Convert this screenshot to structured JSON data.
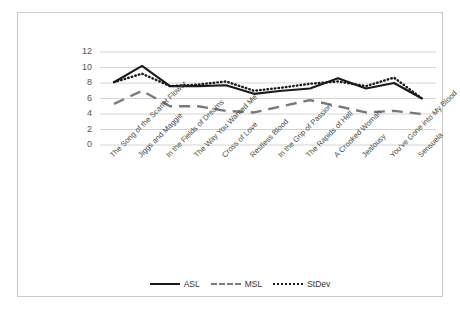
{
  "chart_data": {
    "type": "line",
    "title": "",
    "xlabel": "",
    "ylabel": "",
    "ylim": [
      0,
      12
    ],
    "ytick_step": 2,
    "yticks": [
      12,
      10,
      8,
      6,
      4,
      2,
      0
    ],
    "grid": "horizontal",
    "legend_position": "bottom",
    "categories": [
      "The Song of the Scarlet Flower",
      "Jiggs and Maggie",
      "In the Fields of Dreams",
      "The Way You Wanted Me",
      "Cross of Love",
      "Restless Blood",
      "In the Grip of Passion",
      "The Rapids of Hell",
      "A Crooked Woman",
      "Jealousy",
      "You've Gone into My Blood",
      "Sensuela"
    ],
    "series": [
      {
        "name": "ASL",
        "style": "solid",
        "color": "#1a1a1a",
        "values": [
          8.1,
          10.2,
          7.6,
          7.6,
          7.7,
          6.6,
          7.0,
          7.3,
          8.6,
          7.3,
          8.0,
          6.0
        ]
      },
      {
        "name": "MSL",
        "style": "dashed",
        "color": "#7a7a7a",
        "values": [
          5.3,
          7.0,
          5.0,
          5.0,
          4.4,
          4.2,
          5.0,
          5.8,
          5.0,
          4.2,
          4.4,
          4.0
        ]
      },
      {
        "name": "StDev",
        "style": "dotted",
        "color": "#1a1a1a",
        "values": [
          8.1,
          9.2,
          7.6,
          7.8,
          8.2,
          7.0,
          7.4,
          7.9,
          8.2,
          7.6,
          8.7,
          6.0
        ]
      }
    ]
  },
  "legend": {
    "items": [
      {
        "label": "ASL"
      },
      {
        "label": "MSL"
      },
      {
        "label": "StDev"
      }
    ]
  },
  "colors": {
    "frame_border": "#c8c8c8",
    "gridline": "#c9c9c9",
    "background": "#ffffff"
  }
}
